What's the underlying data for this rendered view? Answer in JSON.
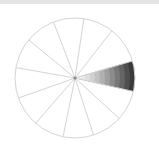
{
  "diagram": {
    "type": "segmented-wheel",
    "center": [
      75,
      78
    ],
    "radius": 60,
    "segment_count": 12,
    "first_spoke_angle_deg": -16.5,
    "spoke_step_deg": 29.5,
    "spoke_color": "#d4d4d4",
    "rim_color": "#d4d4d4",
    "highlighted_segment": {
      "index": 0,
      "fill": "radial-gradient-stepped",
      "inner_color": "#f2f2f2",
      "outer_color": "#3a3a3a",
      "steps": 12
    },
    "center_dot_color": "#888888"
  },
  "top_strip": {
    "color": "#e4e4e4"
  }
}
